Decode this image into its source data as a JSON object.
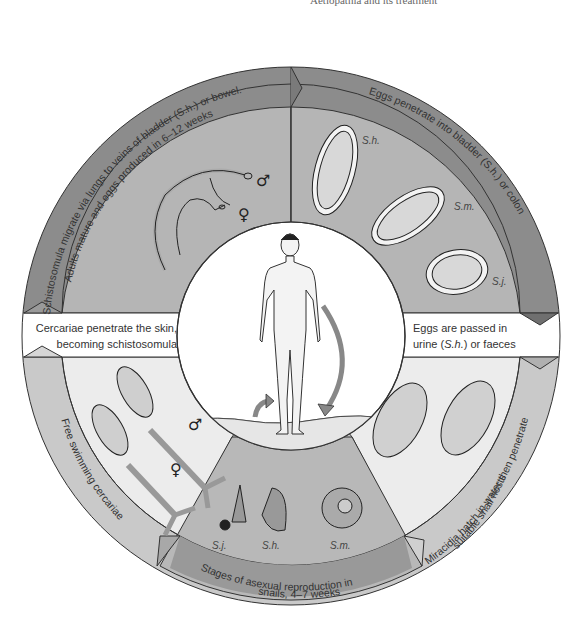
{
  "header": {
    "text": "Aetiopathia and its treatment"
  },
  "diagram": {
    "center": {
      "figure": "human-figure"
    },
    "stages": [
      {
        "id": "migrate",
        "ring_line1": "Schistosomula migrate via lungs to veins of  bladder (S.h.) or bowel.",
        "ring_line2": "Adults mature and eggs produced in 6–12 weeks",
        "male_symbol": "♂",
        "female_symbol": "♀"
      },
      {
        "id": "eggs_penetrate",
        "ring_line1": "Eggs penetrate into bladder (S.h.) or colon",
        "egg_labels": [
          "S.h.",
          "S.m.",
          "S.j."
        ]
      },
      {
        "id": "eggs_passed",
        "band_line1": "Eggs are passed in",
        "band_line2_pre": "urine (",
        "band_line2_em": "S.h.",
        "band_line2_post": ") or faeces"
      },
      {
        "id": "miracidia",
        "ring_line1": "Miracidia hatch in water then penetrate",
        "ring_line2": "suitable snail hosts"
      },
      {
        "id": "snails",
        "ring_line1": "Stages of asexual reproduction in",
        "ring_line2": "snails, 4–7 weeks",
        "snail_labels": [
          "S.j.",
          "S.h.",
          "S.m."
        ]
      },
      {
        "id": "cercariae",
        "ring_line1": "Free swimming cercariae",
        "male_symbol": "♂",
        "female_symbol": "♀"
      },
      {
        "id": "penetrate_skin",
        "band_line1": "Cercariae penetrate the skin,",
        "band_line2": "becoming schistosomula"
      }
    ]
  },
  "colors": {
    "outer_ring_dark": "#8c8c8c",
    "outer_ring_light": "#c9c9c9",
    "segment_mid": "#b3b3b3",
    "segment_light": "#ececec",
    "white": "#ffffff",
    "stroke": "#333333"
  }
}
